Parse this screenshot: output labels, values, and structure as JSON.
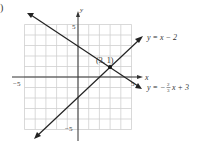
{
  "figure_label": ")",
  "chart_data": {
    "type": "line",
    "title": "",
    "xlabel": "x",
    "ylabel": "y",
    "xlim": [
      -5,
      5
    ],
    "ylim": [
      -5,
      5
    ],
    "grid": true,
    "grid_step": 1,
    "x_tick_labels": [
      {
        "value": -5,
        "label": "−5"
      },
      {
        "value": 5,
        "label": "5"
      }
    ],
    "y_tick_labels": [
      {
        "value": 5,
        "label": "5"
      },
      {
        "value": -5,
        "label": "−5"
      }
    ],
    "series": [
      {
        "name": "y = x − 2",
        "slope": 1,
        "intercept": -2,
        "points": [
          [
            -4,
            -6
          ],
          [
            6,
            4
          ]
        ]
      },
      {
        "name": "y = −(2/3)x + 3",
        "slope": -0.6667,
        "intercept": 3,
        "points": [
          [
            -4.6,
            6.07
          ],
          [
            6,
            -1
          ]
        ]
      }
    ],
    "annotations": [
      {
        "text": "(3, 1)",
        "x": 3,
        "y": 1,
        "type": "intersection-point"
      }
    ],
    "legend": "inline labels at line ends (right)"
  },
  "labels": {
    "x_axis": "x",
    "y_axis": "y",
    "x_min": "−5",
    "x_max": "5",
    "y_max": "5",
    "y_min": "−5",
    "point": "(3, 1)",
    "line1_prefix": "y = x − 2",
    "line2_prefix": "y = −",
    "line2_num": "2",
    "line2_den": "3",
    "line2_suffix": "x + 3"
  },
  "colors": {
    "grid": "#cfcfcf",
    "axis": "#333333",
    "line": "#222222",
    "text": "#333333"
  }
}
